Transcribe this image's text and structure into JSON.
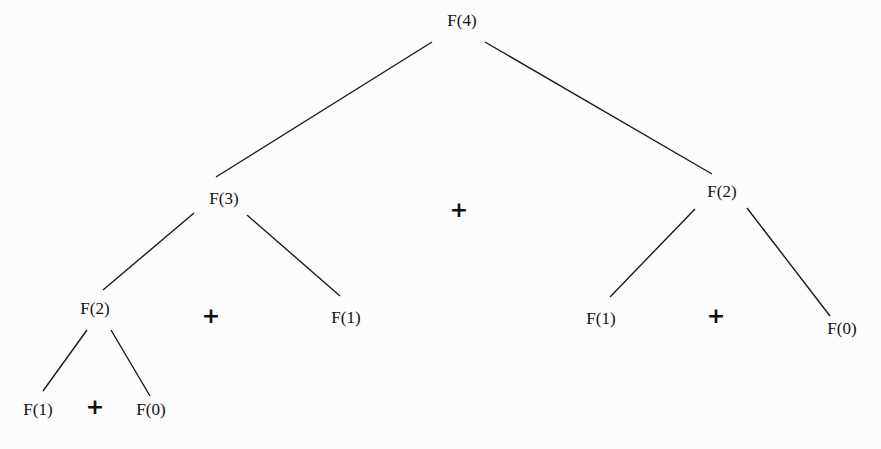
{
  "diagram": {
    "title": "",
    "nodes": [
      {
        "id": "n4",
        "label": "F(4)",
        "x": 462,
        "y": 20
      },
      {
        "id": "n3",
        "label": "F(3)",
        "x": 224,
        "y": 198
      },
      {
        "id": "n2r",
        "label": "F(2)",
        "x": 722,
        "y": 191
      },
      {
        "id": "n2l",
        "label": "F(2)",
        "x": 95,
        "y": 308
      },
      {
        "id": "n1m",
        "label": "F(1)",
        "x": 346,
        "y": 317
      },
      {
        "id": "n1r",
        "label": "F(1)",
        "x": 601,
        "y": 318
      },
      {
        "id": "n0r",
        "label": "F(0)",
        "x": 842,
        "y": 328
      },
      {
        "id": "n1l",
        "label": "F(1)",
        "x": 38,
        "y": 409
      },
      {
        "id": "n0l",
        "label": "F(0)",
        "x": 151,
        "y": 409
      }
    ],
    "operators": [
      {
        "label": "+",
        "x": 459,
        "y": 210
      },
      {
        "label": "+",
        "x": 211,
        "y": 316
      },
      {
        "label": "+",
        "x": 716,
        "y": 316
      },
      {
        "label": "+",
        "x": 95,
        "y": 407
      }
    ],
    "edges": [
      {
        "from": "n4",
        "to": "n3",
        "x1": 432,
        "y1": 42,
        "x2": 216,
        "y2": 177
      },
      {
        "from": "n4",
        "to": "n2r",
        "x1": 485,
        "y1": 42,
        "x2": 712,
        "y2": 174
      },
      {
        "from": "n3",
        "to": "n2l",
        "x1": 194,
        "y1": 213,
        "x2": 103,
        "y2": 290
      },
      {
        "from": "n3",
        "to": "n1m",
        "x1": 247,
        "y1": 215,
        "x2": 340,
        "y2": 296
      },
      {
        "from": "n2r",
        "to": "n1r",
        "x1": 695,
        "y1": 209,
        "x2": 610,
        "y2": 297
      },
      {
        "from": "n2r",
        "to": "n0r",
        "x1": 747,
        "y1": 208,
        "x2": 830,
        "y2": 316
      },
      {
        "from": "n2l",
        "to": "n1l",
        "x1": 87,
        "y1": 330,
        "x2": 43,
        "y2": 391
      },
      {
        "from": "n2l",
        "to": "n0l",
        "x1": 111,
        "y1": 330,
        "x2": 150,
        "y2": 396
      }
    ]
  }
}
